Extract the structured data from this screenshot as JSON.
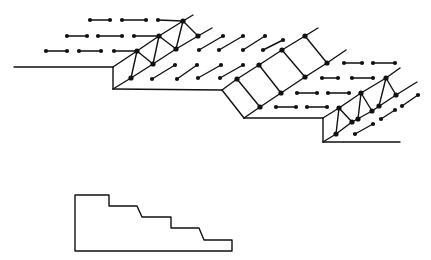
{
  "figure": {
    "colors": {
      "stroke": "#111111",
      "background": "#ffffff"
    },
    "upper_drawing": {
      "outline_lines": [
        [
          [
            14,
            67
          ],
          [
            113,
            67
          ]
        ],
        [
          [
            113,
            67
          ],
          [
            113,
            89
          ]
        ],
        [
          [
            113,
            67
          ],
          [
            137,
            51
          ]
        ],
        [
          [
            113,
            89
          ],
          [
            222,
            90
          ]
        ],
        [
          [
            113,
            89
          ],
          [
            131,
            78
          ],
          [
            153,
            64
          ],
          [
            176,
            49
          ],
          [
            198,
            36
          ],
          [
            212,
            28
          ]
        ],
        [
          [
            137,
            51
          ],
          [
            159,
            36
          ],
          [
            183,
            21
          ],
          [
            193,
            15
          ]
        ],
        [
          [
            222,
            90
          ],
          [
            237,
            79
          ],
          [
            259,
            65
          ],
          [
            282,
            50
          ],
          [
            305,
            36
          ],
          [
            318,
            28
          ]
        ],
        [
          [
            222,
            90
          ],
          [
            244,
            118
          ]
        ],
        [
          [
            244,
            118
          ],
          [
            260,
            107
          ],
          [
            281,
            93
          ],
          [
            305,
            77
          ],
          [
            327,
            63
          ],
          [
            346,
            50
          ]
        ],
        [
          [
            244,
            118
          ],
          [
            323,
            118
          ]
        ],
        [
          [
            323,
            118
          ],
          [
            323,
            142
          ]
        ],
        [
          [
            323,
            118
          ],
          [
            339,
            108
          ],
          [
            361,
            93
          ],
          [
            386,
            78
          ],
          [
            400,
            68
          ]
        ],
        [
          [
            323,
            142
          ],
          [
            336,
            134
          ],
          [
            352,
            122
          ],
          [
            372,
            111
          ],
          [
            396,
            95
          ],
          [
            417,
            82
          ]
        ],
        [
          [
            323,
            142
          ],
          [
            400,
            142
          ]
        ]
      ],
      "truss_left": {
        "top_nodes": [
          [
            137,
            51
          ],
          [
            159,
            36
          ],
          [
            183,
            21
          ]
        ],
        "bottom_nodes": [
          [
            131,
            78
          ],
          [
            153,
            64
          ],
          [
            176,
            49
          ],
          [
            198,
            36
          ]
        ],
        "members": [
          [
            [
              131,
              78
            ],
            [
              137,
              51
            ]
          ],
          [
            [
              137,
              51
            ],
            [
              153,
              64
            ]
          ],
          [
            [
              153,
              64
            ],
            [
              159,
              36
            ]
          ],
          [
            [
              159,
              36
            ],
            [
              176,
              49
            ]
          ],
          [
            [
              176,
              49
            ],
            [
              183,
              21
            ]
          ],
          [
            [
              183,
              21
            ],
            [
              198,
              36
            ]
          ]
        ]
      },
      "frame_middle": {
        "top_nodes": [
          [
            237,
            79
          ],
          [
            259,
            65
          ],
          [
            282,
            50
          ],
          [
            305,
            36
          ]
        ],
        "bottom_nodes": [
          [
            260,
            107
          ],
          [
            281,
            93
          ],
          [
            305,
            77
          ],
          [
            327,
            63
          ]
        ],
        "members": [
          [
            [
              237,
              79
            ],
            [
              260,
              107
            ]
          ],
          [
            [
              259,
              65
            ],
            [
              281,
              93
            ]
          ],
          [
            [
              282,
              50
            ],
            [
              305,
              77
            ]
          ],
          [
            [
              305,
              36
            ],
            [
              327,
              63
            ]
          ]
        ]
      },
      "truss_right": {
        "top_nodes": [
          [
            339,
            108
          ],
          [
            361,
            93
          ],
          [
            386,
            78
          ]
        ],
        "bottom_nodes": [
          [
            336,
            134
          ],
          [
            352,
            122
          ],
          [
            358,
            119
          ],
          [
            372,
            111
          ],
          [
            379,
            106
          ],
          [
            396,
            95
          ]
        ],
        "members": [
          [
            [
              336,
              134
            ],
            [
              339,
              108
            ]
          ],
          [
            [
              339,
              108
            ],
            [
              352,
              122
            ]
          ],
          [
            [
              358,
              119
            ],
            [
              361,
              93
            ]
          ],
          [
            [
              361,
              93
            ],
            [
              372,
              111
            ]
          ],
          [
            [
              379,
              106
            ],
            [
              386,
              78
            ]
          ],
          [
            [
              386,
              78
            ],
            [
              396,
              95
            ]
          ]
        ]
      },
      "horizontal_bars": [
        [
          [
            90,
            20
          ],
          [
            110,
            20
          ]
        ],
        [
          [
            122,
            20
          ],
          [
            146,
            20
          ]
        ],
        [
          [
            158,
            20
          ],
          [
            183,
            21
          ]
        ],
        [
          [
            67,
            36
          ],
          [
            87,
            36
          ]
        ],
        [
          [
            98,
            36
          ],
          [
            122,
            36
          ]
        ],
        [
          [
            134,
            36
          ],
          [
            159,
            36
          ]
        ],
        [
          [
            46,
            51
          ],
          [
            67,
            51
          ]
        ],
        [
          [
            79,
            51
          ],
          [
            101,
            51
          ]
        ],
        [
          [
            114,
            51
          ],
          [
            137,
            51
          ]
        ],
        [
          [
            344,
            63
          ],
          [
            362,
            63
          ]
        ],
        [
          [
            373,
            63
          ],
          [
            395,
            63
          ]
        ],
        [
          [
            322,
            78
          ],
          [
            338,
            78
          ]
        ],
        [
          [
            352,
            78
          ],
          [
            373,
            78
          ]
        ],
        [
          [
            297,
            93
          ],
          [
            317,
            93
          ]
        ],
        [
          [
            328,
            93
          ],
          [
            349,
            93
          ]
        ],
        [
          [
            276,
            107
          ],
          [
            296,
            107
          ]
        ],
        [
          [
            307,
            107
          ],
          [
            327,
            107
          ]
        ]
      ],
      "diagonal_bars": [
        [
          [
            199,
            50
          ],
          [
            223,
            36
          ]
        ],
        [
          [
            219,
            50
          ],
          [
            243,
            36
          ]
        ],
        [
          [
            243,
            50
          ],
          [
            265,
            36
          ]
        ],
        [
          [
            263,
            50
          ],
          [
            283,
            40
          ]
        ],
        [
          [
            177,
            79
          ],
          [
            197,
            65
          ]
        ],
        [
          [
            198,
            78
          ],
          [
            221,
            65
          ]
        ],
        [
          [
            220,
            78
          ],
          [
            243,
            65
          ]
        ],
        [
          [
            152,
            79
          ],
          [
            175,
            65
          ]
        ],
        [
          [
            355,
            134
          ],
          [
            373,
            124
          ]
        ],
        [
          [
            381,
            119
          ],
          [
            395,
            110
          ]
        ],
        [
          [
            402,
            106
          ],
          [
            418,
            95
          ]
        ]
      ]
    },
    "lower_profile": {
      "points": [
        [
          75,
          195
        ],
        [
          109,
          195
        ],
        [
          109,
          206
        ],
        [
          137,
          206
        ],
        [
          142,
          217
        ],
        [
          171,
          217
        ],
        [
          171,
          228
        ],
        [
          199,
          228
        ],
        [
          204,
          240
        ],
        [
          232,
          240
        ],
        [
          232,
          251
        ],
        [
          75,
          251
        ]
      ]
    }
  }
}
